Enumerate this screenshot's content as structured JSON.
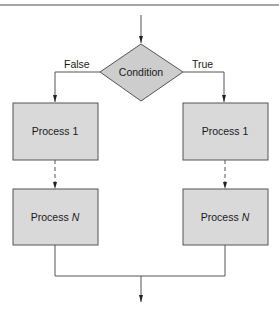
{
  "diagram": {
    "type": "flowchart",
    "colors": {
      "line": "#555555",
      "box_fill": "#d9d9d9",
      "diamond_fill": "#cdcdcd",
      "rule": "#888888"
    },
    "decision": {
      "label": "Condition"
    },
    "branches": {
      "false": {
        "label": "False",
        "process_first": "Process 1",
        "process_last_prefix": "Process ",
        "process_last_var": "N"
      },
      "true": {
        "label": "True",
        "process_first": "Process 1",
        "process_last_prefix": "Process ",
        "process_last_var": "N"
      }
    }
  }
}
